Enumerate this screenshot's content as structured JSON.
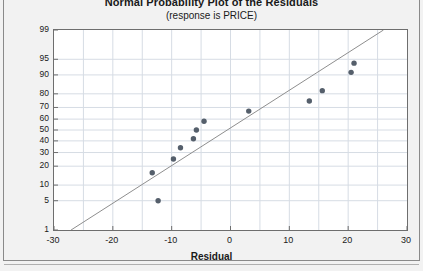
{
  "chart_data": {
    "type": "scatter",
    "title": "Normal Probability Plot of the Residuals",
    "subtitle": "(response is PRICE)",
    "xlabel": "Residual",
    "ylabel": "Percent",
    "xlim": [
      -30,
      30
    ],
    "ylim": [
      1,
      99
    ],
    "yscale": "normal-probability",
    "grid": true,
    "legend": false,
    "xticks": [
      -30,
      -20,
      -10,
      0,
      10,
      20,
      30
    ],
    "xticklabels": [
      "-30",
      "-20",
      "-10",
      "0",
      "10",
      "20",
      "30"
    ],
    "yticks": [
      1,
      5,
      10,
      20,
      30,
      40,
      50,
      60,
      70,
      80,
      90,
      95,
      99
    ],
    "yticklabels": [
      "1",
      "5",
      "10",
      "20",
      "30",
      "40",
      "50",
      "60",
      "70",
      "80",
      "90",
      "95",
      "99"
    ],
    "series": [
      {
        "name": "Residual percentiles",
        "marker": "filled-circle",
        "color": "#555f6b",
        "points": [
          {
            "x": -12.3,
            "y": 5
          },
          {
            "x": -13.3,
            "y": 16
          },
          {
            "x": -9.7,
            "y": 25
          },
          {
            "x": -8.5,
            "y": 34
          },
          {
            "x": -6.3,
            "y": 42
          },
          {
            "x": -5.8,
            "y": 50
          },
          {
            "x": -4.5,
            "y": 58
          },
          {
            "x": 3.1,
            "y": 67
          },
          {
            "x": 13.4,
            "y": 75
          },
          {
            "x": 15.6,
            "y": 82
          },
          {
            "x": 20.5,
            "y": 91
          },
          {
            "x": 21.0,
            "y": 94
          }
        ]
      }
    ],
    "reference_line": {
      "name": "normal fit line",
      "color": "#8e8e8e",
      "x_start": -27.1,
      "y_start": 1,
      "x_end": 26.0,
      "y_end": 99
    },
    "colors": {
      "marker": "#555f6b",
      "line": "#8e8e8e",
      "grid": "#d6dce4",
      "axis": "#6e6e6e",
      "plot_background": "#ffffff",
      "panel_background": "#f2f2f2",
      "text": "#1a1a1a"
    }
  }
}
